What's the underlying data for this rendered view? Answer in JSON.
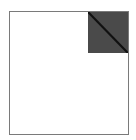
{
  "icon": {
    "name": "document-folded-corner",
    "page_color": "#ffffff",
    "border_color": "#7a7a7a",
    "corner_color": "#4a4a4a",
    "fold_line_color": "#111111"
  }
}
